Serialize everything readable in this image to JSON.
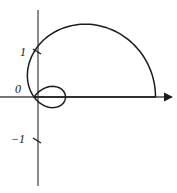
{
  "figure": {
    "background_color": "#ffffff",
    "stroke_color": "#1a1a1a",
    "axis_color": "#4a4a4a"
  },
  "axes": {
    "origin_px": {
      "x": 34,
      "y": 97
    },
    "unit_px": 45,
    "x_axis": {
      "name": "horizontal-axis",
      "has_arrow": true,
      "arrow_direction": "right",
      "start_px": {
        "x": 0,
        "y": 97
      },
      "end_px": {
        "x": 172,
        "y": 97
      }
    },
    "y_axis": {
      "name": "vertical-axis",
      "has_arrow": false,
      "start_px": {
        "x": 38,
        "y": 10
      },
      "end_px": {
        "x": 38,
        "y": 186
      }
    },
    "ticks": [
      {
        "label": "1",
        "value": 1,
        "axis": "y",
        "y_px": 52
      },
      {
        "label": "0",
        "value": 0,
        "axis": "y",
        "y_px": 97
      },
      {
        "label": "−1",
        "value": -1,
        "axis": "y",
        "y_px": 141
      }
    ]
  },
  "labels": {
    "one": "1",
    "zero": "0",
    "negative_one": "−1"
  },
  "chart_data": {
    "type": "line",
    "subtype": "polar",
    "equation": "r = a + b cos(theta), b > a",
    "xlabel": "",
    "ylabel": "",
    "grid": false,
    "legend": false,
    "xlim": [
      -0.8,
      3.1
    ],
    "ylim": [
      -2.0,
      2.0
    ],
    "parameters": {
      "a": 1.0,
      "b": 1.7
    },
    "features": {
      "outer_loop_max_x": 2.7,
      "inner_loop_max_x": 0.87,
      "top_extreme_y": 1.72,
      "bottom_extreme_y": 1.67,
      "y_axis_crossings": [
        1.05,
        -1.0
      ],
      "origin_crossing": true
    },
    "series": [
      {
        "name": "outer-loop",
        "theta_deg": [
          0,
          15,
          30,
          45,
          60,
          75,
          90,
          105,
          120,
          126,
          180,
          234,
          240,
          255,
          270,
          285,
          300,
          315,
          330,
          345,
          360
        ],
        "r": [
          2.7,
          2.64,
          2.47,
          2.2,
          1.85,
          1.44,
          1.0,
          0.56,
          0.15,
          0.0,
          -0.7,
          0.0,
          0.15,
          0.56,
          1.0,
          1.44,
          1.85,
          2.2,
          2.47,
          2.64,
          2.7
        ]
      },
      {
        "name": "inner-loop",
        "theta_deg": [
          126,
          135,
          150,
          165,
          180,
          195,
          210,
          225,
          234
        ],
        "r": [
          0.0,
          -0.2,
          -0.47,
          -0.64,
          -0.7,
          -0.64,
          -0.47,
          -0.2,
          0.0
        ]
      }
    ]
  }
}
